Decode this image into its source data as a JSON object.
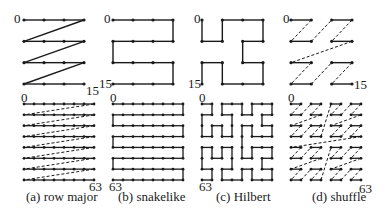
{
  "figure": {
    "line_color": "#1a1a1a",
    "background": "#ffffff",
    "panels": [
      {
        "id": "a",
        "caption": "(a) row major",
        "curve": "row-major",
        "small": {
          "n": 4,
          "x0": 24,
          "x1": 84,
          "y0": 20,
          "y1": 84,
          "start_label": "0",
          "end_label": "15"
        },
        "large": {
          "n": 8,
          "x0": 24,
          "x1": 94,
          "y0": 104,
          "y1": 180,
          "start_label": "0",
          "end_label": "63"
        }
      },
      {
        "id": "b",
        "caption": "(b) snakelike",
        "curve": "snake",
        "small": {
          "n": 4,
          "x0": 113,
          "x1": 173,
          "y0": 20,
          "y1": 84,
          "start_label": "0",
          "end_label": "15"
        },
        "large": {
          "n": 8,
          "x0": 113,
          "x1": 183,
          "y0": 104,
          "y1": 180,
          "start_label": "0",
          "end_label": "63"
        }
      },
      {
        "id": "c",
        "caption": "(c) Hilbert",
        "curve": "hilbert",
        "small": {
          "n": 4,
          "x0": 202,
          "x1": 263,
          "y0": 20,
          "y1": 84,
          "start_label": "0",
          "end_label": "15"
        },
        "large": {
          "n": 8,
          "x0": 202,
          "x1": 272,
          "y0": 104,
          "y1": 180,
          "start_label": "0",
          "end_label": "63"
        }
      },
      {
        "id": "d",
        "caption": "(d) shuffle",
        "curve": "shuffle",
        "small": {
          "n": 4,
          "x0": 291,
          "x1": 352,
          "y0": 20,
          "y1": 84,
          "start_label": "0",
          "end_label": "15"
        },
        "large": {
          "n": 8,
          "x0": 291,
          "x1": 361,
          "y0": 104,
          "y1": 180,
          "start_label": "0",
          "end_label": "63"
        }
      }
    ]
  },
  "labels": {
    "a_small_start": "0",
    "a_small_end": "15",
    "a_large_start": "0",
    "a_large_end": "63",
    "a_caption": "(a) row major",
    "b_small_start": "0",
    "b_small_end": "15",
    "b_large_start": "0",
    "b_large_end": "63",
    "b_caption": "(b) snakelike",
    "c_small_start": "0",
    "c_small_end": "15",
    "c_large_start": "0",
    "c_large_end": "63",
    "c_caption": "(c) Hilbert",
    "d_small_start": "0",
    "d_small_end": "15",
    "d_large_start": "0",
    "d_large_end": "63",
    "d_caption": "(d) shuffle"
  }
}
